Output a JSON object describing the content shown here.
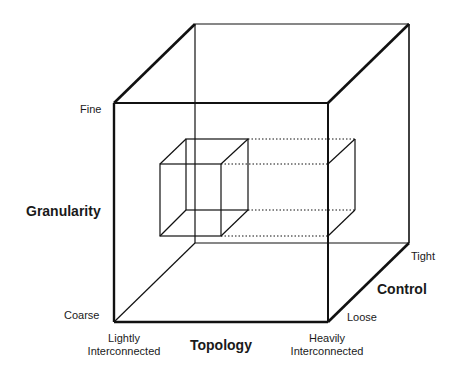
{
  "diagram": {
    "type": "3d-cube-design-space",
    "axes": {
      "granularity": {
        "title": "Granularity",
        "low": "Coarse",
        "high": "Fine"
      },
      "topology": {
        "title": "Topology",
        "low": "Lightly\nInterconnected",
        "low_line1": "Lightly",
        "low_line2": "Interconnected",
        "high_line1": "Heavily",
        "high_line2": "Interconnected"
      },
      "control": {
        "title": "Control",
        "low": "Loose",
        "high": "Tight"
      }
    },
    "colors": {
      "line": "#111111",
      "background": "#ffffff"
    }
  }
}
